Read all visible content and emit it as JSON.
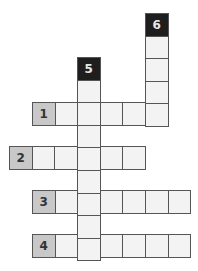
{
  "puzzle": {
    "type": "crossword",
    "cell_size": 22.6,
    "colors": {
      "cell": "#f3f3f3",
      "label_cell": "#c8c8c8",
      "black_cell": "#1e1e1e",
      "border": "#555555"
    },
    "across": [
      {
        "number": "1",
        "label_x": 32,
        "y": 102,
        "length": 5
      },
      {
        "number": "2",
        "label_x": 9,
        "y": 146,
        "length": 5
      },
      {
        "number": "3",
        "label_x": 32,
        "y": 190,
        "length": 6
      },
      {
        "number": "4",
        "label_x": 32,
        "y": 234,
        "length": 6
      }
    ],
    "down": [
      {
        "number": "5",
        "x": 77,
        "label_y": 57,
        "length": 8
      },
      {
        "number": "6",
        "x": 145,
        "label_y": 13,
        "length": 4
      }
    ]
  }
}
